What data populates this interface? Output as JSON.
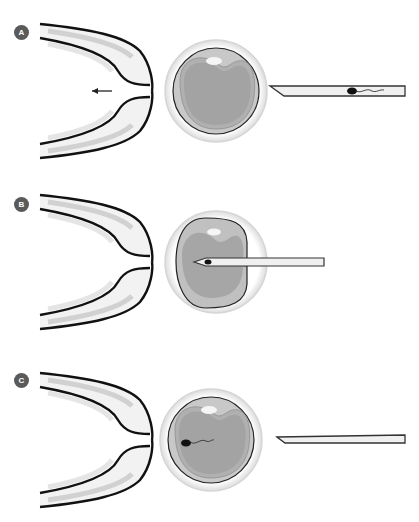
{
  "figure": {
    "panels": [
      {
        "id": "A",
        "label": "A",
        "step": "Holding pipette holds oocyte; injection needle with sperm approaches"
      },
      {
        "id": "B",
        "label": "B",
        "step": "Needle pierces zona and injects sperm into cytoplasm"
      },
      {
        "id": "C",
        "label": "C",
        "step": "Needle withdrawn; sperm remains inside oocyte"
      }
    ]
  },
  "colors": {
    "label_bg": "#5a5a5a",
    "outline": "#111111",
    "zona": "#eeeeee",
    "ooplasm_outer": "#b8b8b8",
    "ooplasm_inner": "#a6a6a6",
    "polar_body": "#f4f4f4"
  }
}
